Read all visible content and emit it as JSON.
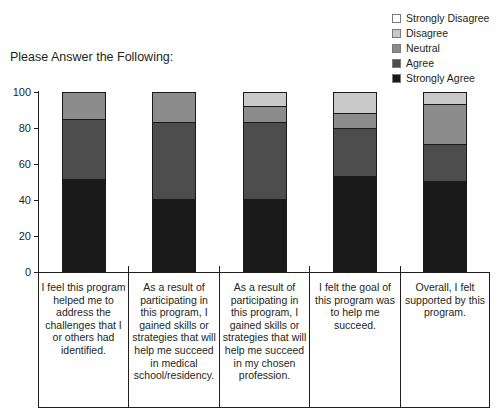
{
  "chart_data": {
    "type": "bar",
    "subtype": "stacked-bar-100",
    "title": "Please Answer the Following:",
    "xlabel": "",
    "ylabel": "",
    "ylim": [
      0,
      100
    ],
    "yticks": [
      0,
      20,
      40,
      60,
      80,
      100
    ],
    "grid": false,
    "legend_position": "top-right",
    "stack_order_bottom_to_top": [
      "Strongly Agree",
      "Agree",
      "Neutral",
      "Disagree",
      "Strongly Disagree"
    ],
    "categories": [
      "I feel this program helped me to address the challenges that I or others had identified.",
      "As a result of participating in this program, I gained skills or strategies that will help me succeed in medical school/residency.",
      "As a result of participating in this program, I gained skills or strategies that will help me succeed in my chosen profession.",
      "I felt the goal of this program was to help me succeed.",
      "Overall, I felt supported by this program."
    ],
    "series": [
      {
        "name": "Strongly Agree",
        "color": "#1a1a1a",
        "values": [
          51,
          40,
          40,
          53,
          50
        ]
      },
      {
        "name": "Agree",
        "color": "#4d4d4d",
        "values": [
          34,
          43,
          43,
          27,
          21
        ]
      },
      {
        "name": "Neutral",
        "color": "#8c8c8c",
        "values": [
          15,
          17,
          9,
          8,
          22
        ]
      },
      {
        "name": "Disagree",
        "color": "#c9c9c9",
        "values": [
          0,
          0,
          8,
          12,
          7
        ]
      },
      {
        "name": "Strongly Disagree",
        "color": "#ffffff",
        "values": [
          0,
          0,
          0,
          0,
          0
        ]
      }
    ]
  },
  "legend": {
    "items": [
      {
        "label": "Strongly Disagree",
        "color": "#ffffff"
      },
      {
        "label": "Disagree",
        "color": "#c9c9c9"
      },
      {
        "label": "Neutral",
        "color": "#8c8c8c"
      },
      {
        "label": "Agree",
        "color": "#4d4d4d"
      },
      {
        "label": "Strongly Agree",
        "color": "#1a1a1a"
      }
    ]
  }
}
